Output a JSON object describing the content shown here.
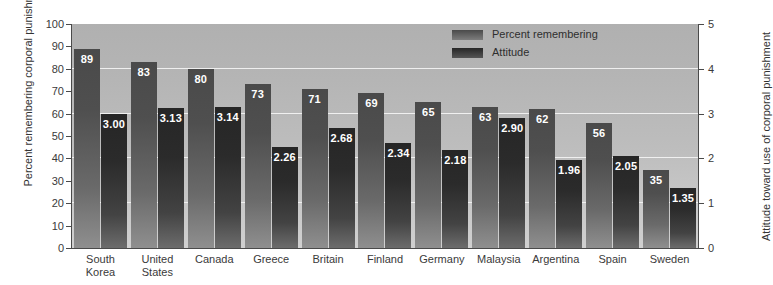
{
  "chart_data": {
    "type": "bar",
    "title": "",
    "xlabel": "",
    "ylabel": "Percent remembering corporal punishment as a child",
    "ylabel_line1": "Percent remembering corporal",
    "ylabel_line2": "punishment as a child",
    "y2label": "Attitude toward use of corporal punishment",
    "ylim": [
      0,
      100
    ],
    "y2lim": [
      0,
      5
    ],
    "yticks": [
      0,
      10,
      20,
      30,
      40,
      50,
      60,
      70,
      80,
      90,
      100
    ],
    "y2ticks": [
      0,
      1,
      2,
      3,
      4,
      5
    ],
    "grid": true,
    "gridlines_at": [
      20,
      40,
      60,
      80
    ],
    "legend_position": "top-right",
    "categories": [
      "South Korea",
      "United States",
      "Canada",
      "Greece",
      "Britain",
      "Finland",
      "Germany",
      "Malaysia",
      "Argentina",
      "Spain",
      "Sweden"
    ],
    "category_lines": [
      [
        "South",
        "Korea"
      ],
      [
        "United",
        "States"
      ],
      [
        "Canada"
      ],
      [
        "Greece"
      ],
      [
        "Britain"
      ],
      [
        "Finland"
      ],
      [
        "Germany"
      ],
      [
        "Malaysia"
      ],
      [
        "Argentina"
      ],
      [
        "Spain"
      ],
      [
        "Sweden"
      ]
    ],
    "series": [
      {
        "name": "Percent remembering",
        "axis": "left",
        "color": "#4a4a4a",
        "values": [
          89,
          83,
          80,
          73,
          71,
          69,
          65,
          63,
          62,
          56,
          35
        ],
        "labels": [
          "89",
          "83",
          "80",
          "73",
          "71",
          "69",
          "65",
          "63",
          "62",
          "56",
          "35"
        ]
      },
      {
        "name": "Attitude",
        "axis": "right",
        "color": "#262626",
        "values": [
          3.0,
          3.13,
          3.14,
          2.26,
          2.68,
          2.34,
          2.18,
          2.9,
          1.96,
          2.05,
          1.35
        ],
        "labels": [
          "3.00",
          "3.13",
          "3.14",
          "2.26",
          "2.68",
          "2.34",
          "2.18",
          "2.90",
          "1.96",
          "2.05",
          "1.35"
        ]
      }
    ]
  },
  "legend": {
    "items": [
      {
        "label": "Percent remembering"
      },
      {
        "label": "Attitude"
      }
    ]
  },
  "colors": {
    "plot_background_top": "#b0b0b0",
    "plot_background_bottom": "#d0d0d0",
    "gridline": "#f2f2f2",
    "axis": "#4a4a4a",
    "bar_percent": "#4a4a4a",
    "bar_attitude": "#262626",
    "bar_label_text": "#ffffff"
  }
}
